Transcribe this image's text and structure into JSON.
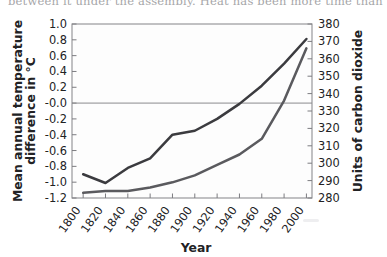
{
  "page": {
    "bleed_text": "between it under the assembly. Heat has been more time than the lung",
    "background_color": "#ffffff"
  },
  "chart_data": {
    "type": "line",
    "title": "",
    "xlabel": "Year",
    "ylabel": "Mean annual temperature difference in °C",
    "y2label": "Units of carbon dioxide",
    "xlim": [
      1790,
      2005
    ],
    "ylim": [
      -1.2,
      1.0
    ],
    "y2lim": [
      280,
      380
    ],
    "grid": false,
    "legend": "none",
    "x": [
      1800,
      1820,
      1840,
      1860,
      1880,
      1900,
      1920,
      1940,
      1960,
      1980,
      2000
    ],
    "xticks": [
      "1800",
      "1820",
      "1840",
      "1860",
      "1880",
      "1900",
      "1920",
      "1940",
      "1960",
      "1980",
      "2000"
    ],
    "yticks": [
      "1.0",
      "0.8",
      "0.6",
      "0.4",
      "0.2",
      "-0.0",
      "-0.2",
      "-0.4",
      "-0.6",
      "-0.8",
      "-1.0",
      "-1.2"
    ],
    "ytick_values": [
      1.0,
      0.8,
      0.6,
      0.4,
      0.2,
      0.0,
      -0.2,
      -0.4,
      -0.6,
      -0.8,
      -1.0,
      -1.2
    ],
    "y2ticks": [
      "380",
      "370",
      "360",
      "350",
      "340",
      "330",
      "320",
      "310",
      "300",
      "290",
      "280"
    ],
    "y2tick_values": [
      380,
      370,
      360,
      350,
      340,
      330,
      320,
      310,
      300,
      290,
      280
    ],
    "zero_line": 0.0,
    "series": [
      {
        "name": "Mean annual temperature difference",
        "axis": "left",
        "color": "#3b3b3f",
        "x": [
          1800,
          1820,
          1840,
          1860,
          1880,
          1900,
          1920,
          1940,
          1960,
          1980,
          2000
        ],
        "values": [
          -0.9,
          -1.01,
          -0.82,
          -0.7,
          -0.4,
          -0.35,
          -0.2,
          -0.01,
          0.22,
          0.5,
          0.81
        ]
      },
      {
        "name": "Units of carbon dioxide",
        "axis": "right",
        "color": "#5a5a5e",
        "x": [
          1800,
          1820,
          1840,
          1860,
          1880,
          1900,
          1920,
          1940,
          1960,
          1980,
          2000
        ],
        "values": [
          283,
          284,
          284,
          286,
          289,
          293,
          299,
          305,
          314,
          336,
          366
        ]
      }
    ]
  }
}
